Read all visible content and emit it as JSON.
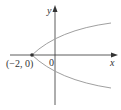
{
  "figure": {
    "type": "parabola",
    "equation": "x = y^2 - 2",
    "vertex_label": "(−2, 0)",
    "origin_label": "0",
    "x_axis_label": "x",
    "y_axis_label": "y",
    "curve_color": "#a0a0a0",
    "axis_color": "#333333"
  }
}
